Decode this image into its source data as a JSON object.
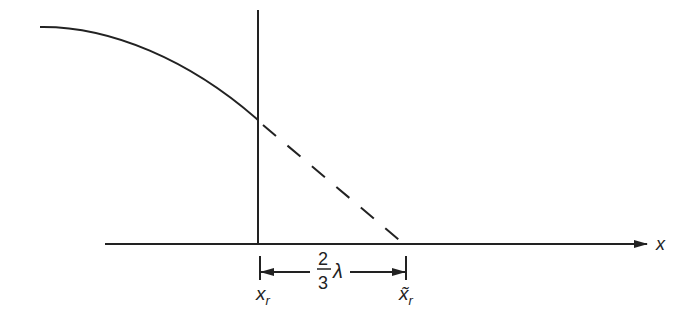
{
  "diagram": {
    "axis_label": "x",
    "left_marker": {
      "base": "x",
      "sub": "r"
    },
    "right_marker": {
      "base": "x̃",
      "sub": "r"
    },
    "fraction": {
      "numerator": "2",
      "denominator": "3"
    },
    "lambda": "λ",
    "colors": {
      "stroke": "#222222",
      "background": "#ffffff"
    }
  }
}
